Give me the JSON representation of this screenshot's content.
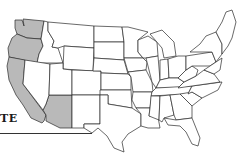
{
  "map": {
    "title": "United States map",
    "caption_fragment": "TE",
    "colors": {
      "shaded": "#b9b9b9",
      "unshaded": "#ffffff",
      "border": "#2a2a2a"
    },
    "highlighted_states": [
      "Washington",
      "Oregon",
      "California",
      "Arizona"
    ],
    "states": [
      {
        "name": "Washington",
        "shaded": true
      },
      {
        "name": "Oregon",
        "shaded": true
      },
      {
        "name": "California",
        "shaded": true
      },
      {
        "name": "Arizona",
        "shaded": true
      },
      {
        "name": "Idaho",
        "shaded": false
      },
      {
        "name": "Nevada",
        "shaded": false
      },
      {
        "name": "Montana",
        "shaded": false
      },
      {
        "name": "Wyoming",
        "shaded": false
      },
      {
        "name": "Utah",
        "shaded": false
      },
      {
        "name": "Colorado",
        "shaded": false
      },
      {
        "name": "New Mexico",
        "shaded": false
      },
      {
        "name": "North Dakota",
        "shaded": false
      },
      {
        "name": "South Dakota",
        "shaded": false
      },
      {
        "name": "Nebraska",
        "shaded": false
      },
      {
        "name": "Kansas",
        "shaded": false
      },
      {
        "name": "Oklahoma",
        "shaded": false
      },
      {
        "name": "Texas",
        "shaded": false
      },
      {
        "name": "Minnesota",
        "shaded": false
      },
      {
        "name": "Iowa",
        "shaded": false
      },
      {
        "name": "Missouri",
        "shaded": false
      },
      {
        "name": "Arkansas",
        "shaded": false
      },
      {
        "name": "Louisiana",
        "shaded": false
      },
      {
        "name": "Wisconsin",
        "shaded": false
      },
      {
        "name": "Illinois",
        "shaded": false
      },
      {
        "name": "Michigan",
        "shaded": false
      },
      {
        "name": "Indiana",
        "shaded": false
      },
      {
        "name": "Ohio",
        "shaded": false
      },
      {
        "name": "Kentucky",
        "shaded": false
      },
      {
        "name": "Tennessee",
        "shaded": false
      },
      {
        "name": "Mississippi",
        "shaded": false
      },
      {
        "name": "Alabama",
        "shaded": false
      },
      {
        "name": "Georgia",
        "shaded": false
      },
      {
        "name": "Florida",
        "shaded": false
      },
      {
        "name": "South Carolina",
        "shaded": false
      },
      {
        "name": "North Carolina",
        "shaded": false
      },
      {
        "name": "Virginia",
        "shaded": false
      },
      {
        "name": "West Virginia",
        "shaded": false
      },
      {
        "name": "Pennsylvania",
        "shaded": false
      },
      {
        "name": "New York",
        "shaded": false
      },
      {
        "name": "New England",
        "shaded": false
      }
    ]
  }
}
